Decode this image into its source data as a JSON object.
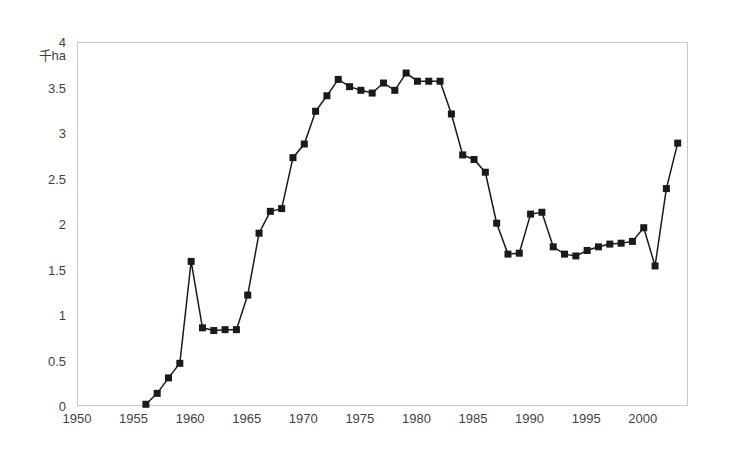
{
  "chart_data": {
    "type": "line",
    "title": "",
    "subtitle": "",
    "xlabel": "",
    "ylabel": "千ha",
    "unit_label": "千ha",
    "xlim": [
      1950,
      2004
    ],
    "ylim": [
      0,
      4
    ],
    "grid": false,
    "legend": null,
    "marker": "filled-square",
    "line_color": "#1a1a1a",
    "marker_color": "#1a1a1a",
    "border_color": "#c8c8c8",
    "x_ticks": [
      1950,
      1955,
      1960,
      1965,
      1970,
      1975,
      1980,
      1985,
      1990,
      1995,
      2000
    ],
    "x_tick_labels": [
      "1950",
      "1955",
      "1960",
      "1965",
      "1970",
      "1975",
      "1980",
      "1985",
      "1990",
      "1995",
      "2000"
    ],
    "y_ticks": [
      0,
      0.5,
      1,
      1.5,
      2,
      2.5,
      3,
      3.5,
      4
    ],
    "y_tick_labels": [
      "0",
      "0.5",
      "1",
      "1.5",
      "2",
      "2.5",
      "3",
      "3.5",
      "4"
    ],
    "x": [
      1956,
      1957,
      1958,
      1959,
      1960,
      1961,
      1962,
      1963,
      1964,
      1965,
      1966,
      1967,
      1968,
      1969,
      1970,
      1971,
      1972,
      1973,
      1974,
      1975,
      1976,
      1977,
      1978,
      1979,
      1980,
      1981,
      1982,
      1983,
      1984,
      1985,
      1986,
      1987,
      1988,
      1989,
      1990,
      1991,
      1992,
      1993,
      1994,
      1995,
      1996,
      1997,
      1998,
      1999,
      2000,
      2001,
      2002,
      2003
    ],
    "values": [
      0.03,
      0.15,
      0.32,
      0.48,
      1.6,
      0.87,
      0.84,
      0.85,
      0.85,
      1.23,
      1.91,
      2.15,
      2.18,
      2.74,
      2.89,
      3.25,
      3.42,
      3.6,
      3.52,
      3.48,
      3.45,
      3.56,
      3.48,
      3.67,
      3.58,
      3.58,
      3.58,
      3.22,
      2.77,
      2.72,
      2.58,
      2.02,
      1.68,
      1.69,
      2.12,
      2.14,
      1.76,
      1.68,
      1.66,
      1.72,
      1.76,
      1.79,
      1.8,
      1.82,
      1.97,
      1.55,
      2.4,
      2.9
    ],
    "series": [
      {
        "name": "area",
        "values": [
          0.03,
          0.15,
          0.32,
          0.48,
          1.6,
          0.87,
          0.84,
          0.85,
          0.85,
          1.23,
          1.91,
          2.15,
          2.18,
          2.74,
          2.89,
          3.25,
          3.42,
          3.6,
          3.52,
          3.48,
          3.45,
          3.56,
          3.48,
          3.67,
          3.58,
          3.58,
          3.58,
          3.22,
          2.77,
          2.72,
          2.58,
          2.02,
          1.68,
          1.69,
          2.12,
          2.14,
          1.76,
          1.68,
          1.66,
          1.72,
          1.76,
          1.79,
          1.8,
          1.82,
          1.97,
          1.55,
          2.4,
          2.9
        ]
      }
    ]
  }
}
